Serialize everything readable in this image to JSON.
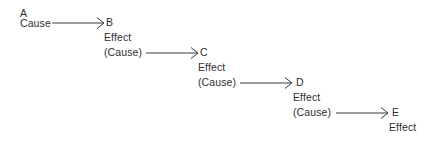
{
  "diagram": {
    "type": "causal-chain",
    "canvas": {
      "width": 447,
      "height": 141
    },
    "text_color": "#2f2f2f",
    "line_color": "#3a3a3a",
    "background": "#ffffff",
    "nodes": [
      {
        "id": "A",
        "name": "A",
        "role_label": "Cause",
        "effect_label": "",
        "cause_label": "",
        "x": 20,
        "y": 8
      },
      {
        "id": "B",
        "name": "B",
        "role_label": "",
        "effect_label": "Effect",
        "cause_label": "(Cause)",
        "x": 106,
        "y": 18
      },
      {
        "id": "C",
        "name": "C",
        "role_label": "",
        "effect_label": "Effect",
        "cause_label": "(Cause)",
        "x": 200,
        "y": 48
      },
      {
        "id": "D",
        "name": "D",
        "role_label": "",
        "effect_label": "Effect",
        "cause_label": "(Cause)",
        "x": 296,
        "y": 78
      },
      {
        "id": "E",
        "name": "E",
        "role_label": "",
        "effect_label": "Effect",
        "cause_label": "",
        "x": 392,
        "y": 108
      }
    ],
    "edges": [
      {
        "id": "edge-a-b",
        "from": "A",
        "to": "B",
        "x1": 52,
        "x2": 104,
        "y": 23
      },
      {
        "id": "edge-b-c",
        "from": "B",
        "to": "C",
        "x1": 146,
        "x2": 198,
        "y": 53
      },
      {
        "id": "edge-c-d",
        "from": "C",
        "to": "D",
        "x1": 240,
        "x2": 293,
        "y": 83
      },
      {
        "id": "edge-d-e",
        "from": "D",
        "to": "E",
        "x1": 336,
        "x2": 389,
        "y": 113
      }
    ],
    "labels": {
      "a_title": "A",
      "a_cause": "Cause",
      "b_title": "B",
      "b_effect": "Effect",
      "b_cause": "(Cause)",
      "c_title": "C",
      "c_effect": "Effect",
      "c_cause": "(Cause)",
      "d_title": "D",
      "d_effect": "Effect",
      "d_cause": "(Cause)",
      "e_title": "E",
      "e_effect": "Effect"
    }
  }
}
